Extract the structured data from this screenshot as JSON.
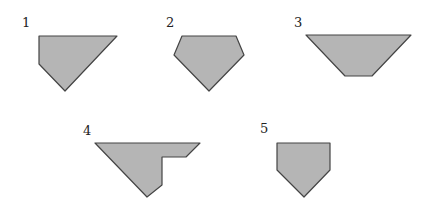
{
  "diagram": {
    "fill_color": "#b5b5b5",
    "stroke_color": "#444444",
    "shapes": [
      {
        "label": "1",
        "label_pos": [
          22,
          27
        ],
        "points": "39,36 117,36 65,91 39,64"
      },
      {
        "label": "2",
        "label_pos": [
          166,
          27
        ],
        "points": "182,36 236,36 244,55 209,91 174,55"
      },
      {
        "label": "3",
        "label_pos": [
          294,
          27
        ],
        "points": "306,35 411,35 372,76 345,76"
      },
      {
        "label": "4",
        "label_pos": [
          83,
          135
        ],
        "points": "95,143 200,143 186,157 162,157 162,185 147,197"
      },
      {
        "label": "5",
        "label_pos": [
          260,
          133
        ],
        "points": "277,143 330,143 330,170 304,197 277,170"
      }
    ]
  }
}
